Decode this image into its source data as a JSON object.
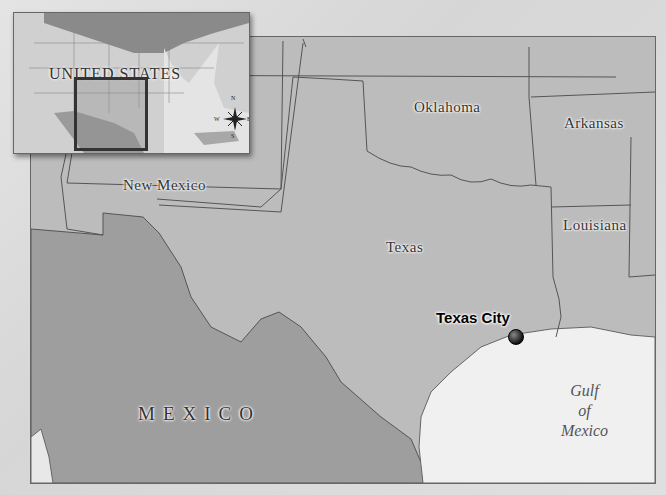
{
  "map": {
    "type": "locator-map",
    "palette": {
      "land_us": "#bcbcbc",
      "land_mexico": "#9e9e9e",
      "water": "#f2f2f2",
      "border": "#555555",
      "frame": "#666666"
    },
    "inset": {
      "title": "UNITED STATES",
      "compass": {
        "n": "N",
        "s": "S",
        "e": "E",
        "w": "W"
      }
    },
    "states": [
      {
        "name": "Oklahoma"
      },
      {
        "name": "Arkansas"
      },
      {
        "name": "New Mexico"
      },
      {
        "name": "Louisiana"
      },
      {
        "name": "Texas"
      }
    ],
    "country": {
      "name": "MEXICO"
    },
    "water_body": {
      "line1": "Gulf",
      "line2": "of",
      "line3": "Mexico"
    },
    "city": {
      "name": "Texas City",
      "marker": "black-dot"
    }
  }
}
